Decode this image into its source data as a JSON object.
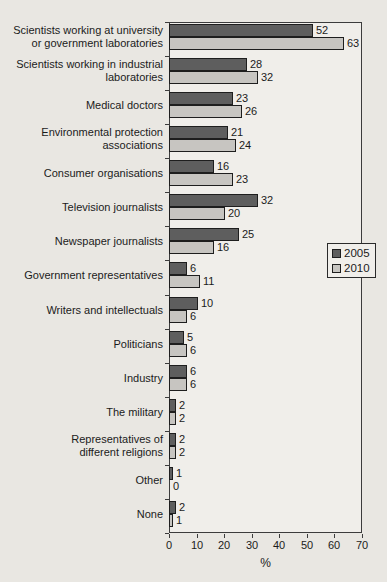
{
  "chart_data": {
    "type": "bar",
    "orientation": "horizontal",
    "title": "",
    "xlabel": "%",
    "xlim": [
      0,
      70
    ],
    "xticks": [
      0,
      10,
      20,
      30,
      40,
      50,
      60,
      70
    ],
    "grid": false,
    "legend_position": "middle-right",
    "categories": [
      "Scientists working at university\nor government laboratories",
      "Scientists working in industrial\nlaboratories",
      "Medical doctors",
      "Environmental protection\nassociations",
      "Consumer organisations",
      "Television journalists",
      "Newspaper journalists",
      "Government representatives",
      "Writers and intellectuals",
      "Politicians",
      "Industry",
      "The military",
      "Representatives of\ndifferent religions",
      "Other",
      "None"
    ],
    "series": [
      {
        "name": "2005",
        "color": "#5e5e5e",
        "values": [
          52,
          28,
          23,
          21,
          16,
          32,
          25,
          6,
          10,
          5,
          6,
          2,
          2,
          1,
          2
        ]
      },
      {
        "name": "2010",
        "color": "#c7c5c1",
        "values": [
          63,
          32,
          26,
          24,
          23,
          20,
          16,
          11,
          6,
          6,
          6,
          2,
          2,
          0,
          1
        ]
      }
    ]
  },
  "colors": {
    "background": "#e9e7e2",
    "plot_background": "#f0eeea",
    "border": "#3c3c3c",
    "text": "#1b1b1b"
  }
}
